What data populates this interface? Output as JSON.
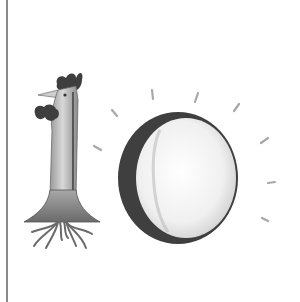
{
  "illustration": {
    "subject": "number ten",
    "digits": [
      "1",
      "0"
    ],
    "one_as": "chicken",
    "zero_as": "sun",
    "ray_count": 10
  },
  "colors": {
    "background": "#ffffff",
    "rule": "#8a8a8a",
    "dark_ink": "#3e3e3e",
    "mid_gray": "#8c8c8c",
    "light_gray": "#d9d9d9"
  }
}
